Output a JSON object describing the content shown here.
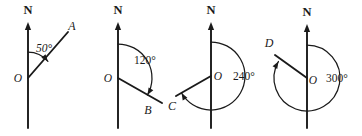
{
  "figure": {
    "background_color": "#ffffff",
    "ink_color": "#1a1a1a",
    "width": 362,
    "height": 136
  },
  "diagrams": [
    {
      "id": "bearing-50",
      "north_label": "N",
      "origin_label": "O",
      "point_label": "A",
      "angle_label": "50°",
      "bearing_degrees": 50,
      "arc_direction": "clockwise",
      "origin": {
        "x": 28,
        "y": 78
      },
      "north_tip": {
        "y": 22
      },
      "axis_bottom": {
        "y": 128
      },
      "ray_end": {
        "x": 68,
        "y": 32
      },
      "north_label_pos": {
        "x": 28,
        "y": 14
      },
      "origin_label_pos": {
        "x": 18,
        "y": 82
      },
      "point_label_pos": {
        "x": 72,
        "y": 30
      },
      "angle_label_pos": {
        "x": 44,
        "y": 52
      },
      "angle_label_style": "slanted",
      "arc_radius": 26
    },
    {
      "id": "bearing-120",
      "north_label": "N",
      "origin_label": "O",
      "point_label": "B",
      "angle_label": "120°",
      "bearing_degrees": 120,
      "arc_direction": "clockwise",
      "origin": {
        "x": 118,
        "y": 78
      },
      "north_tip": {
        "y": 22
      },
      "axis_bottom": {
        "y": 128
      },
      "ray_end": {
        "x": 162,
        "y": 103
      },
      "north_label_pos": {
        "x": 118,
        "y": 14
      },
      "origin_label_pos": {
        "x": 108,
        "y": 82
      },
      "point_label_pos": {
        "x": 148,
        "y": 114
      },
      "angle_label_pos": {
        "x": 145,
        "y": 64
      },
      "angle_label_style": "upright",
      "arc_radius": 34
    },
    {
      "id": "bearing-240",
      "north_label": "N",
      "origin_label": "O",
      "point_label": "C",
      "angle_label": "240°",
      "bearing_degrees": 240,
      "arc_direction": "clockwise",
      "origin": {
        "x": 211,
        "y": 76
      },
      "north_tip": {
        "y": 22
      },
      "axis_bottom": {
        "y": 128
      },
      "ray_end": {
        "x": 176,
        "y": 96
      },
      "north_label_pos": {
        "x": 211,
        "y": 14
      },
      "origin_label_pos": {
        "x": 218,
        "y": 80
      },
      "point_label_pos": {
        "x": 172,
        "y": 110
      },
      "angle_label_pos": {
        "x": 244,
        "y": 80
      },
      "angle_label_style": "upright",
      "arc_radius": 34
    },
    {
      "id": "bearing-300",
      "north_label": "N",
      "origin_label": "O",
      "point_label": "D",
      "angle_label": "300°",
      "bearing_degrees": 300,
      "arc_direction": "clockwise",
      "origin": {
        "x": 307,
        "y": 78
      },
      "north_tip": {
        "y": 24
      },
      "axis_bottom": {
        "y": 128
      },
      "ray_end": {
        "x": 275,
        "y": 55
      },
      "north_label_pos": {
        "x": 307,
        "y": 16
      },
      "origin_label_pos": {
        "x": 313,
        "y": 84
      },
      "point_label_pos": {
        "x": 269,
        "y": 47
      },
      "angle_label_pos": {
        "x": 337,
        "y": 82
      },
      "angle_label_style": "upright",
      "arc_radius": 33
    }
  ]
}
